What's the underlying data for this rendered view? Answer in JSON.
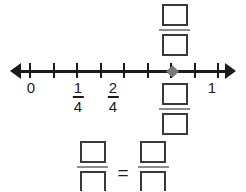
{
  "figure": {
    "type": "number-line-fraction-worksheet",
    "colors": {
      "line": "#1b1b1b",
      "marker": "#787878",
      "box_border": "#3a3a3a",
      "fraction_bar": "#8c8c8c",
      "background": "#ffffff"
    }
  },
  "number_line": {
    "name": "number-line",
    "range": [
      0,
      1
    ],
    "tick_count": 9,
    "tick_positions": [
      0,
      0.125,
      0.25,
      0.375,
      0.5,
      0.625,
      0.75,
      0.875,
      1
    ],
    "tick_x": [
      30,
      54,
      78,
      101,
      125,
      148,
      172,
      195,
      219
    ],
    "left_arrow": "arrow-left",
    "right_arrow": "arrow-right",
    "labels": [
      {
        "kind": "whole",
        "text": "0",
        "x": 31
      },
      {
        "kind": "fraction",
        "numerator": "1",
        "denominator": "4",
        "x": 78
      },
      {
        "kind": "fraction",
        "numerator": "2",
        "denominator": "4",
        "x": 113
      },
      {
        "kind": "whole",
        "text": "1",
        "x": 212
      }
    ],
    "marker": {
      "name": "point-marker",
      "shape": "diamond",
      "x": 172,
      "value": "3/4"
    }
  },
  "answer_blanks": {
    "above_line": {
      "name": "fraction-above-line",
      "numerator": "",
      "denominator": "",
      "x": 159,
      "y": 4
    },
    "below_line": {
      "name": "fraction-below-line",
      "numerator": "",
      "denominator": "",
      "x": 159,
      "y": 83
    },
    "equation": {
      "name": "equivalence-equation",
      "left": {
        "numerator": "",
        "denominator": ""
      },
      "operator": "=",
      "right": {
        "numerator": "",
        "denominator": ""
      }
    }
  }
}
